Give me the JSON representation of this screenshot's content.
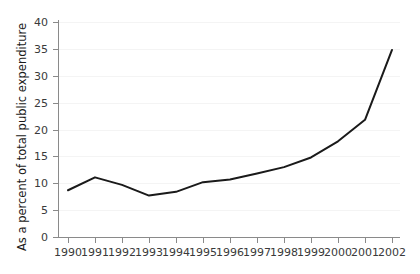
{
  "chart_data": {
    "type": "line",
    "title": "",
    "xlabel": "",
    "ylabel": "As a percent of total public expenditure",
    "x": [
      1990,
      1991,
      1992,
      1993,
      1994,
      1995,
      1996,
      1997,
      1998,
      1999,
      2000,
      2001,
      2002
    ],
    "categories": [
      "1990",
      "1991",
      "1992",
      "1993",
      "1994",
      "1995",
      "1996",
      "1997",
      "1998",
      "1999",
      "2000",
      "2001",
      "2002"
    ],
    "values": [
      8.7,
      11.1,
      9.7,
      7.7,
      8.4,
      10.2,
      10.7,
      11.8,
      13.0,
      14.8,
      17.8,
      21.8,
      34.8
    ],
    "series": [
      {
        "name": "As a percent of total public expenditure",
        "values": [
          8.7,
          11.1,
          9.7,
          7.7,
          8.4,
          10.2,
          10.7,
          11.8,
          13.0,
          14.8,
          17.8,
          21.8,
          34.8
        ]
      }
    ],
    "ylim": [
      0,
      40
    ],
    "xlim": [
      1990,
      2002
    ],
    "yticks": [
      0,
      5,
      10,
      15,
      20,
      25,
      30,
      35,
      40
    ],
    "ytick_labels": [
      "0",
      "5",
      "10",
      "15",
      "20",
      "25",
      "30",
      "35",
      "40"
    ],
    "xticks": [
      1990,
      1991,
      1992,
      1993,
      1994,
      1995,
      1996,
      1997,
      1998,
      1999,
      2000,
      2001,
      2002
    ],
    "xtick_labels": [
      "1990",
      "1991",
      "1992",
      "1993",
      "1994",
      "1995",
      "1996",
      "1997",
      "1998",
      "1999",
      "2000",
      "2001",
      "2002"
    ],
    "grid": true,
    "grid_axis": "y",
    "legend": false,
    "legend_position": "none",
    "markers": false,
    "line_color": "#1a1a1a",
    "line_width": 2,
    "background_color": "#ffffff",
    "grid_color": "#f4f4f4",
    "axis_color": "#8a8a8a",
    "tick_label_color": "#3a3a3a"
  }
}
